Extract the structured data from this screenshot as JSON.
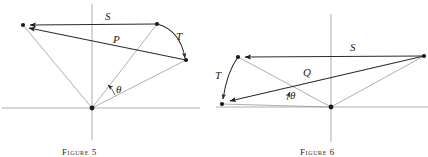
{
  "page": {
    "width": 428,
    "height": 157,
    "background": "#ffffff",
    "ink_color": "#1c1c1c",
    "axis_color": "#9a9a9a",
    "thin_line_color": "#8c8c8c"
  },
  "figures": [
    {
      "id": "figure-5",
      "caption_word": "Figure",
      "caption_number": "5",
      "caption_text": "Figure 5",
      "origin": {
        "x": 92,
        "y": 108
      },
      "axes": {
        "horizontal": {
          "x1": 2,
          "y1": 108,
          "x2": 200,
          "y2": 108
        },
        "vertical": {
          "x1": 92,
          "y1": 4,
          "x2": 92,
          "y2": 140
        }
      },
      "labels": [
        {
          "name": "label-S",
          "text": "S",
          "x": 105,
          "y": 20
        },
        {
          "name": "label-P",
          "text": "P",
          "x": 113,
          "y": 43
        },
        {
          "name": "label-T",
          "text": "T",
          "x": 176,
          "y": 40
        },
        {
          "name": "label-theta",
          "text": "θ",
          "x": 116,
          "y": 93
        }
      ],
      "vertices": [
        {
          "name": "vertex-origin",
          "x": 92,
          "y": 108
        },
        {
          "name": "vertex-left",
          "x": 23,
          "y": 25
        },
        {
          "name": "vertex-top-right",
          "x": 157,
          "y": 24
        },
        {
          "name": "vertex-right",
          "x": 186,
          "y": 60
        }
      ],
      "arrow_vectors": [
        {
          "name": "vector-S",
          "from": [
            157,
            24
          ],
          "to": [
            26,
            25
          ]
        },
        {
          "name": "vector-P",
          "from": [
            186,
            60
          ],
          "to": [
            24,
            27
          ]
        },
        {
          "name": "vector-T-arc",
          "from": [
            157,
            24
          ],
          "to": [
            186,
            60
          ]
        }
      ],
      "thin_segments": [
        {
          "name": "edge-origin-left",
          "from": [
            92,
            108
          ],
          "to": [
            23,
            25
          ]
        },
        {
          "name": "edge-origin-topright",
          "from": [
            92,
            108
          ],
          "to": [
            157,
            24
          ]
        },
        {
          "name": "edge-origin-right",
          "from": [
            92,
            108
          ],
          "to": [
            186,
            60
          ]
        }
      ],
      "angle": {
        "name": "angle-theta",
        "radius": 26,
        "from_deg": 27,
        "to_deg": 52
      }
    },
    {
      "id": "figure-6",
      "caption_word": "Figure",
      "caption_number": "6",
      "caption_text": "Figure 6",
      "origin": {
        "x": 331,
        "y": 107
      },
      "axes": {
        "horizontal": {
          "x1": 216,
          "y1": 107,
          "x2": 428,
          "y2": 107
        },
        "vertical": {
          "x1": 331,
          "y1": 14,
          "x2": 331,
          "y2": 142
        }
      },
      "labels": [
        {
          "name": "label-S",
          "text": "S",
          "x": 350,
          "y": 51
        },
        {
          "name": "label-Q",
          "text": "Q",
          "x": 303,
          "y": 76
        },
        {
          "name": "label-T",
          "text": "T",
          "x": 215,
          "y": 79
        },
        {
          "name": "label-theta",
          "text": "θ",
          "x": 290,
          "y": 99
        }
      ],
      "vertices": [
        {
          "name": "vertex-origin",
          "x": 331,
          "y": 107
        },
        {
          "name": "vertex-top-left",
          "x": 238,
          "y": 57
        },
        {
          "name": "vertex-bottom-left",
          "x": 222,
          "y": 104
        },
        {
          "name": "vertex-right",
          "x": 424,
          "y": 56
        }
      ],
      "arrow_vectors": [
        {
          "name": "vector-S",
          "from": [
            424,
            56
          ],
          "to": [
            241,
            57
          ]
        },
        {
          "name": "vector-Q",
          "from": [
            424,
            56
          ],
          "to": [
            225,
            102
          ]
        },
        {
          "name": "vector-T-arc",
          "from": [
            238,
            57
          ],
          "to": [
            222,
            102
          ]
        }
      ],
      "thin_segments": [
        {
          "name": "edge-origin-topleft",
          "from": [
            331,
            107
          ],
          "to": [
            238,
            57
          ]
        },
        {
          "name": "edge-origin-bottomleft",
          "from": [
            331,
            107
          ],
          "to": [
            222,
            104
          ]
        },
        {
          "name": "edge-origin-right",
          "from": [
            331,
            107
          ],
          "to": [
            424,
            56
          ]
        }
      ],
      "angle": {
        "name": "angle-theta",
        "radius": 44,
        "from_deg": 9,
        "to_deg": 27
      }
    }
  ]
}
